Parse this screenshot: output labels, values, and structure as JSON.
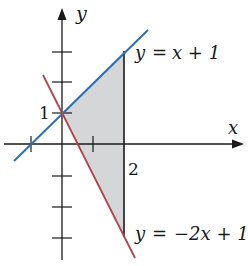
{
  "diagram": {
    "axes": {
      "x_label": "x",
      "y_label": "y"
    },
    "labels": {
      "y_intercept": "1",
      "x_bound": "2",
      "line1": {
        "lhs": "y",
        "eq": "=",
        "rhs": "x + 1"
      },
      "line2": {
        "lhs": "y",
        "eq": "=",
        "rhs": "−2x + 1"
      }
    },
    "colors": {
      "line1": "#2e6fb5",
      "line2": "#b5434a",
      "region_fill": "#d4d6d8",
      "axis": "#1a1a1a"
    },
    "lines": [
      {
        "name": "y = x + 1",
        "slope": 1,
        "intercept": 1
      },
      {
        "name": "y = -2x + 1",
        "slope": -2,
        "intercept": 1
      }
    ],
    "shaded_region": {
      "description": "Region bounded by y = x + 1, y = -2x + 1 and x = 2",
      "vertices": [
        [
          0,
          1
        ],
        [
          2,
          3
        ],
        [
          2,
          -3
        ]
      ]
    },
    "ticks": {
      "x": [
        -1,
        1,
        2
      ],
      "y": [
        -3,
        -2,
        -1,
        1,
        2,
        3
      ]
    }
  }
}
